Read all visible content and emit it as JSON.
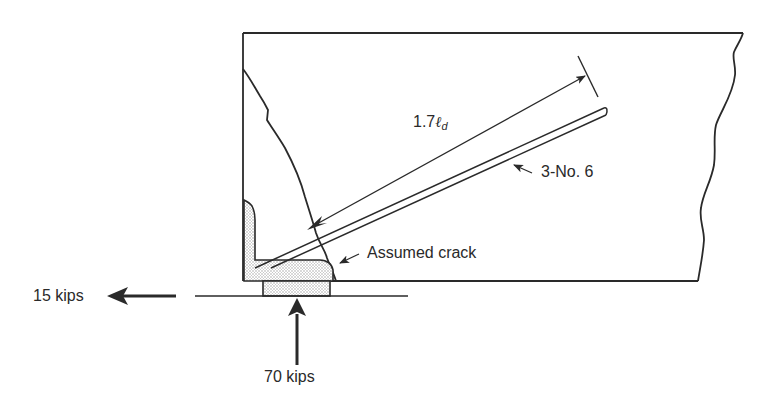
{
  "figure": {
    "type": "Reinforced concrete beam end (corbel/bracket) detail with hooked bars and bearing plate",
    "colors": {
      "ink": "#2a2a2a",
      "background": "#ffffff",
      "stipple": "#d9d9d9"
    }
  },
  "labels": {
    "development_length": {
      "prefix": "1.7",
      "symbol": "ℓ",
      "subscript": "d"
    },
    "reinforcement": "3-No. 6",
    "crack": "Assumed crack",
    "horizontal_force": "15 kips",
    "vertical_force": "70 kips"
  },
  "forces": [
    {
      "name": "horizontal",
      "magnitude": 15,
      "unit": "kips",
      "direction": "left"
    },
    {
      "name": "vertical",
      "magnitude": 70,
      "unit": "kips",
      "direction": "up"
    }
  ]
}
